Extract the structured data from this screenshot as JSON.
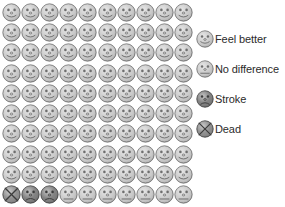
{
  "figure": {
    "type": "pictogram",
    "total_units": 100,
    "rows": 10,
    "columns": 10,
    "unit_shape": "face-icon"
  },
  "chart_data": {
    "type": "pie",
    "title": "",
    "xlabel": "",
    "ylabel": "",
    "categories": [
      "Feel better",
      "No difference",
      "Stroke",
      "Dead"
    ],
    "values": [
      90,
      7,
      2,
      1
    ],
    "unit": "people per 100",
    "legend_position": "right",
    "grid": false
  },
  "legend": {
    "items": [
      {
        "key": "feel-better",
        "label": "Feel better",
        "face": "smile",
        "fill": "#c9c9c9",
        "stroke": "#6e6e6e",
        "count": 90
      },
      {
        "key": "no-difference",
        "label": "No difference",
        "face": "flat",
        "fill": "#c9c9c9",
        "stroke": "#6e6e6e",
        "count": 7
      },
      {
        "key": "stroke",
        "label": "Stroke",
        "face": "frown",
        "fill": "#7b7b7b",
        "stroke": "#3c3c3c",
        "count": 2
      },
      {
        "key": "dead",
        "label": "Dead",
        "face": "cross",
        "fill": "#8a8a8a",
        "stroke": "#3c3c3c",
        "count": 1
      }
    ]
  },
  "grid_sequence": [
    "feel-better",
    "feel-better",
    "feel-better",
    "feel-better",
    "feel-better",
    "feel-better",
    "feel-better",
    "feel-better",
    "feel-better",
    "feel-better",
    "feel-better",
    "feel-better",
    "feel-better",
    "feel-better",
    "feel-better",
    "feel-better",
    "feel-better",
    "feel-better",
    "feel-better",
    "feel-better",
    "feel-better",
    "feel-better",
    "feel-better",
    "feel-better",
    "feel-better",
    "feel-better",
    "feel-better",
    "feel-better",
    "feel-better",
    "feel-better",
    "feel-better",
    "feel-better",
    "feel-better",
    "feel-better",
    "feel-better",
    "feel-better",
    "feel-better",
    "feel-better",
    "feel-better",
    "feel-better",
    "feel-better",
    "feel-better",
    "feel-better",
    "feel-better",
    "feel-better",
    "feel-better",
    "feel-better",
    "feel-better",
    "feel-better",
    "feel-better",
    "feel-better",
    "feel-better",
    "feel-better",
    "feel-better",
    "feel-better",
    "feel-better",
    "feel-better",
    "feel-better",
    "feel-better",
    "feel-better",
    "feel-better",
    "feel-better",
    "feel-better",
    "feel-better",
    "feel-better",
    "feel-better",
    "feel-better",
    "feel-better",
    "feel-better",
    "feel-better",
    "feel-better",
    "feel-better",
    "feel-better",
    "feel-better",
    "feel-better",
    "feel-better",
    "feel-better",
    "feel-better",
    "feel-better",
    "feel-better",
    "feel-better",
    "feel-better",
    "feel-better",
    "feel-better",
    "feel-better",
    "feel-better",
    "feel-better",
    "feel-better",
    "feel-better",
    "feel-better",
    "dead",
    "stroke",
    "stroke",
    "no-difference",
    "no-difference",
    "no-difference",
    "no-difference",
    "no-difference",
    "no-difference",
    "no-difference"
  ]
}
